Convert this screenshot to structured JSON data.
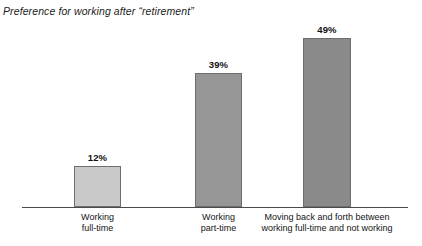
{
  "chart_data": {
    "type": "bar",
    "title": "Preference for working after “retirement”",
    "xlabel": "",
    "ylabel": "",
    "ylim": [
      0,
      60
    ],
    "grid": false,
    "legend": "none",
    "categories": [
      "Working full-time",
      "Working part-time",
      "Moving back and forth between working full-time and not working"
    ],
    "values": [
      12,
      39,
      49
    ],
    "value_labels": [
      "12%",
      "39%",
      "49%"
    ],
    "bars": [
      {
        "value": 12,
        "value_label": "12%",
        "label_lines": [
          "Working",
          "full-time"
        ],
        "fill": "#c9c9c9",
        "border": "#6e6e6e"
      },
      {
        "value": 39,
        "value_label": "39%",
        "label_lines": [
          "Working",
          "part-time"
        ],
        "fill": "#969696",
        "border": "#6e6e6e"
      },
      {
        "value": 49,
        "value_label": "49%",
        "label_lines": [
          "Moving back and forth between",
          "working full-time and not working"
        ],
        "fill": "#8a8a8a",
        "border": "#6e6e6e"
      }
    ],
    "axis_color": "#4a4a4a",
    "background": "#ffffff"
  }
}
